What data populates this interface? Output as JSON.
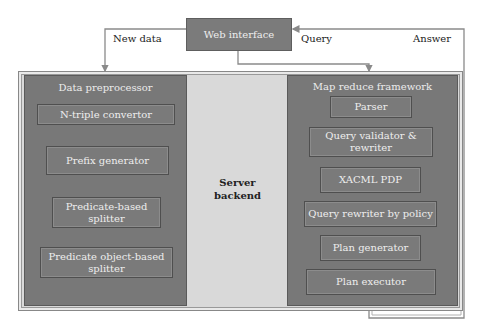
{
  "web_interface": {
    "label": "Web interface"
  },
  "flows": {
    "new_data": "New data",
    "query": "Query",
    "answer": "Answer"
  },
  "server": {
    "label_line1": "Server",
    "label_line2": "backend"
  },
  "data_preprocessor": {
    "title": "Data preprocessor",
    "components": [
      {
        "line1": "N-triple convertor",
        "line2": ""
      },
      {
        "line1": "Prefix generator",
        "line2": ""
      },
      {
        "line1": "Predicate-based",
        "line2": "splitter"
      },
      {
        "line1": "Predicate object-based",
        "line2": "splitter"
      }
    ]
  },
  "map_reduce": {
    "title": "Map reduce framework",
    "components": [
      {
        "line1": "Parser",
        "line2": ""
      },
      {
        "line1": "Query validator &",
        "line2": "rewriter"
      },
      {
        "line1": "XACML PDP",
        "line2": ""
      },
      {
        "line1": "Query rewriter by policy",
        "line2": ""
      },
      {
        "line1": "Plan generator",
        "line2": ""
      },
      {
        "line1": "Plan executor",
        "line2": ""
      }
    ]
  },
  "colors": {
    "box_fill": "#7b7b7b",
    "panel_fill": "#787878",
    "backend_fill": "#d9d9d9",
    "wire": "#8a8a8a"
  }
}
